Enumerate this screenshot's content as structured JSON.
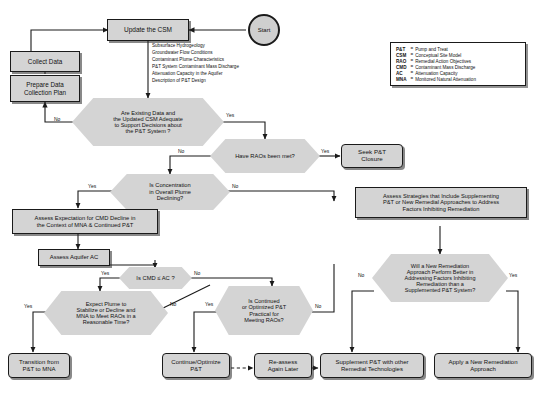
{
  "diagram": {
    "background_color": "#ffffff",
    "node_fill": "#d4d4d4",
    "node_border": "#1a1a1a"
  },
  "nodes": {
    "start": "Start",
    "update_csm": "Update the CSM",
    "collect_data": "Collect Data",
    "prepare_plan": "Prepare Data\nCollection Plan",
    "data_adequate": "Are Existing Data and\nthe Updated CSM Adequate\nto Support Decisions about\nthe P&T System ?",
    "raos_met": "Have RAOs been met?",
    "seek_closure": "Seek P&T\nClosure",
    "conc_declining": "Is Concentration\nin Overall Plume\nDeclining?",
    "assess_expectation": "Assess Expectation for CMD Decline in\nthe Context of MNA & Continued P&T",
    "assess_aquifer_ac": "Assess Aquifer AC",
    "cmd_le_ac": "Is CMD ≤ AC ?",
    "expect_plume": "Expect Plume to\nStabilize or Decline and\nMNA to Meet RAOs in a\nReasonable Time?",
    "continued_practical": "Is Continued\nor Optimized P&T\nPractical for\nMeeting RAOs?",
    "assess_strategies": "Assess Strategies that Include Supplementing\nP&T or New Remedial Approaches to Address\nFactors Inhibiting Remediation",
    "new_remediation_better": "Will a New Remediation\nApproach Perform Better in\nAddressing Factors Inhibiting\nRemediation than a\nSupplemented P&T System?",
    "transition_mna": "Transition from\nP&T to MNA",
    "continue_optimize": "Continue/Optimize\nP&T",
    "reassess_later": "Re-assess\nAgain Later",
    "supplement_pt": "Supplement P&T with other\nRemedial Technologies",
    "apply_new_approach": "Apply a New Remediation\nApproach"
  },
  "notes": {
    "csm_items": [
      "Subsurface Hydrogeology",
      "Groundwater Flow Conditions",
      "Contaminant Plume Characteristics",
      "P&T System Contaminant Mass Discharge",
      "Attenuation Capacity in the Aquifer",
      "Description of P&T Design"
    ]
  },
  "edge_labels": {
    "data_adequate_no": "No",
    "data_adequate_yes": "Yes",
    "raos_met_yes": "Yes",
    "raos_met_no": "No",
    "conc_declining_yes": "Yes",
    "conc_declining_no": "No",
    "cmd_le_ac_yes": "Yes",
    "cmd_le_ac_no": "No",
    "expect_plume_yes": "Yes",
    "expect_plume_no": "No",
    "continued_practical_yes": "Yes",
    "continued_practical_no": "No",
    "new_remediation_no": "No",
    "new_remediation_yes": "Yes"
  },
  "legend": {
    "rows": [
      {
        "abbr": "P&T",
        "eq": "=",
        "definition": "Pump and Treat"
      },
      {
        "abbr": "CSM",
        "eq": "=",
        "definition": "Conceptual Site Model"
      },
      {
        "abbr": "RAO",
        "eq": "=",
        "definition": "Remedial Action Objectives"
      },
      {
        "abbr": "CMD",
        "eq": "=",
        "definition": "Contaminant Mass Discharge"
      },
      {
        "abbr": "AC",
        "eq": "=",
        "definition": "Attenuation Capacity"
      },
      {
        "abbr": "MNA",
        "eq": "=",
        "definition": "Monitored Natural Attenuation"
      }
    ]
  }
}
